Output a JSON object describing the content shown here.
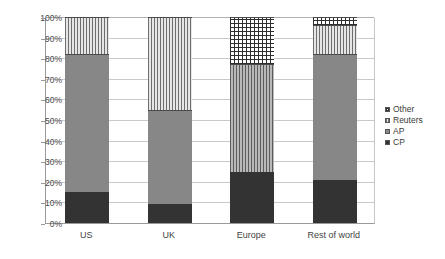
{
  "chart_data": {
    "type": "bar",
    "stacked": true,
    "stack_mode": "percent",
    "title": "",
    "subtitle": "",
    "xlabel": "",
    "ylabel": "",
    "ylim": [
      0,
      100
    ],
    "ytick_labels": [
      "0%",
      "10%",
      "20%",
      "30%",
      "40%",
      "50%",
      "60%",
      "70%",
      "80%",
      "90%",
      "100%"
    ],
    "ytick_values": [
      0,
      10,
      20,
      30,
      40,
      50,
      60,
      70,
      80,
      90,
      100
    ],
    "grid": true,
    "grid_axis": "y",
    "legend_position": "right",
    "legend_order_top_to_bottom": [
      "Other",
      "Reuters",
      "AP",
      "CP"
    ],
    "categories": [
      "US",
      "UK",
      "Europe",
      "Rest of world"
    ],
    "series": [
      {
        "name": "CP",
        "values": [
          15,
          9,
          25,
          21
        ]
      },
      {
        "name": "AP",
        "values": [
          67,
          46,
          52,
          61
        ]
      },
      {
        "name": "Reuters",
        "values": [
          18,
          45,
          23,
          14
        ]
      },
      {
        "name": "Other",
        "values": [
          0,
          0,
          0,
          4
        ]
      }
    ]
  },
  "axis": {
    "yticks": [
      {
        "label": "100%",
        "value": 100
      },
      {
        "label": "90%",
        "value": 90
      },
      {
        "label": "80%",
        "value": 80
      },
      {
        "label": "70%",
        "value": 70
      },
      {
        "label": "60%",
        "value": 60
      },
      {
        "label": "50%",
        "value": 50
      },
      {
        "label": "40%",
        "value": 40
      },
      {
        "label": "30%",
        "value": 30
      },
      {
        "label": "20%",
        "value": 20
      },
      {
        "label": "10%",
        "value": 10
      },
      {
        "label": "0%",
        "value": 0
      }
    ],
    "xlabels": [
      "US",
      "UK",
      "Europe",
      "Rest of world"
    ]
  },
  "bars": [
    {
      "category": "US",
      "segments": [
        {
          "name": "CP",
          "value": 15,
          "fill": "fill-cp"
        },
        {
          "name": "AP",
          "value": 67,
          "fill": "fill-ap-solid"
        },
        {
          "name": "Reuters",
          "value": 18,
          "fill": "fill-reuters"
        }
      ]
    },
    {
      "category": "UK",
      "segments": [
        {
          "name": "CP",
          "value": 9,
          "fill": "fill-cp"
        },
        {
          "name": "AP",
          "value": 46,
          "fill": "fill-ap-solid"
        },
        {
          "name": "Reuters",
          "value": 45,
          "fill": "fill-reuters"
        }
      ]
    },
    {
      "category": "Europe",
      "segments": [
        {
          "name": "CP",
          "value": 25,
          "fill": "fill-cp"
        },
        {
          "name": "AP",
          "value": 52,
          "fill": "fill-ap-stripe"
        },
        {
          "name": "Reuters",
          "value": 23,
          "fill": "fill-other"
        }
      ]
    },
    {
      "category": "Rest of world",
      "segments": [
        {
          "name": "CP",
          "value": 21,
          "fill": "fill-cp"
        },
        {
          "name": "AP",
          "value": 61,
          "fill": "fill-ap-solid"
        },
        {
          "name": "Reuters",
          "value": 14,
          "fill": "fill-reuters"
        },
        {
          "name": "Other",
          "value": 4,
          "fill": "fill-other"
        }
      ]
    }
  ],
  "legend": {
    "items": [
      {
        "label": "Other",
        "swatch": "sw-other"
      },
      {
        "label": "Reuters",
        "swatch": "sw-reuters"
      },
      {
        "label": "AP",
        "swatch": "sw-ap"
      },
      {
        "label": "CP",
        "swatch": "sw-cp"
      }
    ]
  },
  "colors": {
    "cp": "#333333",
    "ap": "#878787",
    "reuters": "#6e6e6e",
    "other": "#2f2f2f",
    "grid": "#c9c9c9",
    "axis": "#9a9a9a",
    "text": "#3a3a3a",
    "background": "#ffffff"
  }
}
